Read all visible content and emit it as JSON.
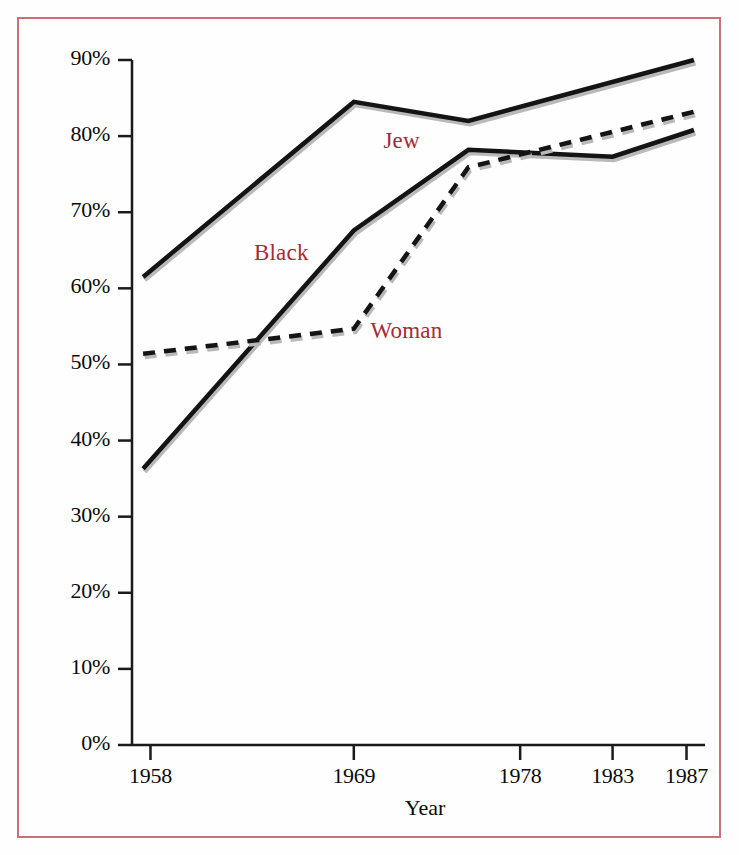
{
  "chart_data": {
    "type": "line",
    "title": "",
    "xlabel": "Year",
    "ylabel": "",
    "xtick_labels": [
      "1958",
      "1969",
      "1978",
      "1983",
      "1987"
    ],
    "xtick_years": [
      1958,
      1969,
      1978,
      1983,
      1987
    ],
    "ytick_labels": [
      "0%",
      "10%",
      "20%",
      "30%",
      "40%",
      "50%",
      "60%",
      "70%",
      "80%",
      "90%"
    ],
    "ytick_values": [
      0,
      10,
      20,
      30,
      40,
      50,
      60,
      70,
      80,
      90
    ],
    "ylim": [
      0,
      90
    ],
    "xlim": [
      1957,
      1988
    ],
    "grid": false,
    "legend": "inline-labels",
    "series": [
      {
        "name": "Jew",
        "label": "Jew",
        "style": "solid",
        "color": "#141414",
        "x": [
          1957.6,
          1969,
          1975.2,
          1987.4
        ],
        "values": [
          61.5,
          84.5,
          82.0,
          90.0
        ]
      },
      {
        "name": "Black",
        "label": "Black",
        "style": "solid",
        "color": "#141414",
        "x": [
          1957.6,
          1969,
          1975.2,
          1983,
          1987.4
        ],
        "values": [
          36.3,
          67.6,
          78.2,
          77.3,
          80.8
        ]
      },
      {
        "name": "Woman",
        "label": "Woman",
        "style": "dashed",
        "color": "#141414",
        "x": [
          1957.6,
          1969,
          1975.2,
          1987.4
        ],
        "values": [
          51.4,
          54.7,
          75.9,
          83.2
        ]
      }
    ],
    "annotations": [
      {
        "text": "Jew",
        "x": 1970.6,
        "y": 79.0
      },
      {
        "text": "Black",
        "x": 1963.6,
        "y": 64.2
      },
      {
        "text": "Woman",
        "x": 1969.9,
        "y": 54.0
      }
    ],
    "colors": {
      "line": "#141414",
      "label": "#a62a34",
      "frame_border": "#c9707a",
      "axis": "#1a1a1a",
      "background": "#fefefe"
    }
  }
}
